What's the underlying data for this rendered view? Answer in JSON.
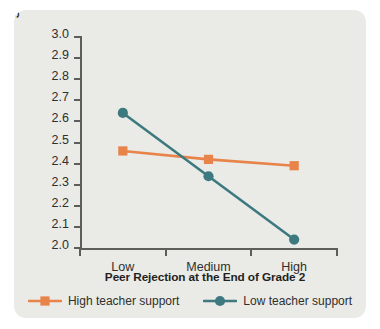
{
  "chart_data": {
    "type": "line",
    "title": "",
    "xlabel": "Peer Rejection at the End of Grade 2",
    "ylabel": "Social Self-Concept at the Beginning of Grade 3",
    "categories": [
      "Low",
      "Medium",
      "High"
    ],
    "ylim": [
      2.0,
      3.0
    ],
    "ytick_step": 0.1,
    "yticks": [
      "3.0",
      "2.9",
      "2.8",
      "2.7",
      "2.6",
      "2.5",
      "2.4",
      "2.3",
      "2.2",
      "2.1",
      "2.0"
    ],
    "grid": false,
    "legend_position": "bottom",
    "series": [
      {
        "name": "High teacher support",
        "color": "#e8834a",
        "marker": "square",
        "values": [
          2.46,
          2.42,
          2.39
        ]
      },
      {
        "name": "Low teacher support",
        "color": "#3d7a80",
        "marker": "circle",
        "values": [
          2.64,
          2.34,
          2.04
        ]
      }
    ]
  },
  "figure": {
    "background_color": "#eaeae6",
    "axis_color": "#5d5d5a"
  }
}
